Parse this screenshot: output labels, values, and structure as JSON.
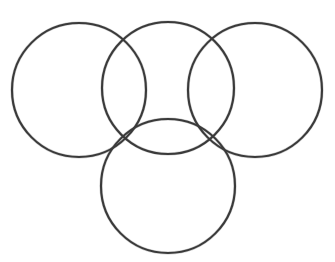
{
  "document": {
    "title": "Four Overlapping Circles Diagram",
    "description": "Line drawing of four equal overlapping circle outlines arranged in a trefoil / pyramid layout on a plain white background",
    "background_color": "#ffffff",
    "width": 335,
    "height": 262
  },
  "style": {
    "stroke_color": "#3a3a3a",
    "stroke_halo_color": "#5c5c5c",
    "stroke_width": 2.1,
    "fill": "none",
    "line_quality": "scanned hand-inked outline, slightly soft edges"
  },
  "diagram": {
    "type": "overlapping-circles",
    "circle_count": 4,
    "arrangement": "three circles in a top row, one circle centered below",
    "circles": [
      {
        "id": "circle-left",
        "label": "left circle",
        "cx": 79,
        "cy": 90,
        "r": 67,
        "bounds": {
          "left": 12,
          "right": 146,
          "top": 23,
          "bottom": 157
        }
      },
      {
        "id": "circle-top-middle",
        "label": "top middle circle",
        "cx": 168,
        "cy": 88,
        "r": 66,
        "bounds": {
          "left": 102,
          "right": 234,
          "top": 22,
          "bottom": 154
        }
      },
      {
        "id": "circle-right",
        "label": "right circle",
        "cx": 255,
        "cy": 90,
        "r": 67,
        "bounds": {
          "left": 188,
          "right": 322,
          "top": 23,
          "bottom": 157
        }
      },
      {
        "id": "circle-bottom",
        "label": "bottom circle",
        "cx": 168,
        "cy": 186,
        "r": 67,
        "bounds": {
          "left": 101,
          "right": 235,
          "top": 119,
          "bottom": 253
        }
      }
    ],
    "intersection_nodes": [
      {
        "id": "node-upper-left",
        "label": "left and top-middle upper crossing",
        "x": 119,
        "y": 44
      },
      {
        "id": "node-upper-right",
        "label": "top-middle and right upper crossing",
        "x": 217,
        "y": 44
      },
      {
        "id": "node-lower-left",
        "label": "triple crossing at lower left",
        "x": 123,
        "y": 138
      },
      {
        "id": "node-lower-right",
        "label": "triple crossing at lower right",
        "x": 214,
        "y": 138
      }
    ],
    "overlap_regions": [
      {
        "id": "lens-left-middle",
        "label": "vertical lens between left and top-middle circles"
      },
      {
        "id": "lens-middle-right",
        "label": "vertical lens between top-middle and right circles"
      },
      {
        "id": "lens-middle-bottom",
        "label": "horizontal lens between top-middle and bottom circles"
      }
    ]
  }
}
